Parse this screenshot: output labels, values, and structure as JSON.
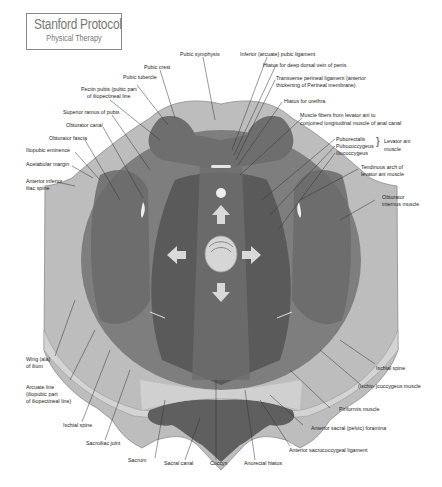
{
  "brand": {
    "title": "Stanford Protocol",
    "subtitle": "Physical Therapy"
  },
  "diagram": {
    "colors": {
      "bone": "#bdbdbd",
      "bone_light": "#d4d4d4",
      "muscle_outer": "#7e7e7e",
      "muscle_mid": "#6a6a6a",
      "muscle_dark": "#555555",
      "sacrum_dark": "#5f5f5f",
      "arrow": "#d9d9d9",
      "leader_line": "#333333"
    },
    "arrows": [
      "up",
      "down",
      "left",
      "right"
    ]
  },
  "labels": {
    "pubic_crest": "Pubic crest",
    "pubic_symphysis": "Pubic symphysis",
    "inferior_pubic_ligament": "Inferior (arcuate) pubic ligament",
    "hiatus_dorsal_vein": "Hiatus for deep dorsal vein of penis",
    "transverse_perineal_1": "Transverse perineal ligament (anterior",
    "transverse_perineal_2": "thickening of Perineal membrane)",
    "hiatus_urethra": "Hiatus for urethra",
    "muscle_fibers_1": "Muscle fibers from levator ani to",
    "muscle_fibers_2": "conjoined longitudinal muscle of anal canal",
    "puborectalis": "Puborectalis",
    "pubococcygeus": "Pubococcygeus",
    "iliococcygeus": "Iliococcygeus",
    "levator_ani_1": "Levator ani",
    "levator_ani_2": "muscle",
    "tendinous_arch_1": "Tendinous arch of",
    "tendinous_arch_2": "levator ani muscle",
    "obturator_internus_1": "Obturator",
    "obturator_internus_2": "internus muscle",
    "pubic_tubercle": "Pubic tubercle",
    "pectin_pubis_1": "Pectin pubis (pubic part",
    "pectin_pubis_2": "of iliopectineal line",
    "superior_ramus": "Superior ramus of pubis",
    "obturator_canal": "Obturator canal",
    "obturator_fascia": "Obturator fascia",
    "iliopubic_eminence": "Iliopubic eminence",
    "acetabular_margin": "Acetabular margin",
    "anterior_inferior_iliac_1": "Anterior inferior",
    "anterior_inferior_iliac_2": "iliac spine",
    "wing_ilium_1": "Wing (ala)",
    "wing_ilium_2": "of ilium",
    "arcuate_line_1": "Arcuate line",
    "arcuate_line_2": "(iliopubic part",
    "arcuate_line_3": "of iliopectineal line)",
    "ischial_spine_left": "Ischial spine",
    "sacroiliac_joint": "Sacroiliac joint",
    "sacrum": "Sacrum",
    "sacral_canal": "Sacral canal",
    "coccyx": "Coccyx",
    "anorectal_hiatus": "Anorectal hiatus",
    "anterior_sacrococcygeal": "Anterior sacrococcygeal ligament",
    "anterior_sacral_foramina": "Anterior sacral (pelvic) foramina",
    "piriformis": "Piriformis muscle",
    "ischiococcygeus": "(Ischio-)coccygeus muscle",
    "ischial_spine_right": "Ischial spine"
  }
}
